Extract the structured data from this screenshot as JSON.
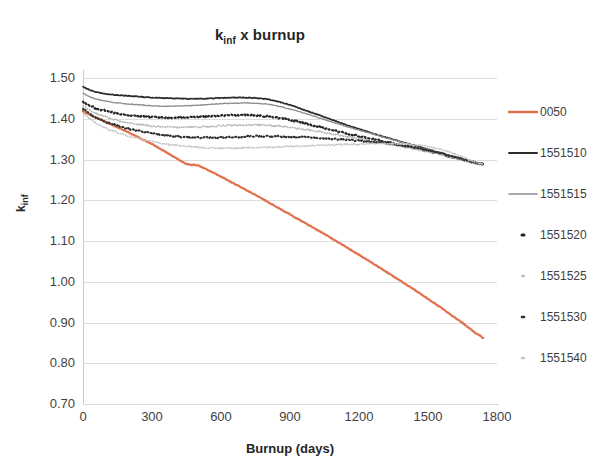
{
  "chart_data": {
    "type": "line",
    "title_main": "k",
    "title_sub": "inf",
    "title_rest": " x burnup",
    "xlabel": "Burnup (days)",
    "ylabel": "k_inf",
    "ylabel_main": "k",
    "ylabel_sub": "inf",
    "xlim": [
      0,
      1800
    ],
    "ylim": [
      0.7,
      1.5
    ],
    "grid": true,
    "legend_position": "right",
    "xticks": [
      0,
      300,
      600,
      900,
      1200,
      1500,
      1800
    ],
    "xtick_labels": [
      "0",
      "300",
      "600",
      "900",
      "1200",
      "1500",
      "1800"
    ],
    "yticks": [
      0.7,
      0.8,
      0.9,
      1.0,
      1.1,
      1.2,
      1.3,
      1.4,
      1.5
    ],
    "ytick_labels": [
      "0.70",
      "0.80",
      "0.90",
      "1.00",
      "1.10",
      "1.20",
      "1.30",
      "1.40",
      "1.50"
    ],
    "x": [
      0,
      50,
      100,
      150,
      200,
      250,
      300,
      350,
      400,
      450,
      500,
      550,
      600,
      650,
      700,
      750,
      800,
      850,
      900,
      950,
      1000,
      1050,
      1100,
      1150,
      1200,
      1250,
      1300,
      1350,
      1400,
      1450,
      1500,
      1550,
      1600,
      1650,
      1700,
      1740
    ],
    "series": [
      {
        "name": "0050",
        "color": "#E1704C",
        "style": "solid",
        "width": 2.2,
        "values": [
          1.418,
          1.405,
          1.392,
          1.379,
          1.366,
          1.352,
          1.338,
          1.322,
          1.305,
          1.288,
          1.286,
          1.272,
          1.258,
          1.243,
          1.228,
          1.213,
          1.197,
          1.181,
          1.165,
          1.149,
          1.133,
          1.117,
          1.1,
          1.083,
          1.066,
          1.049,
          1.031,
          1.013,
          0.995,
          0.977,
          0.958,
          0.939,
          0.919,
          0.899,
          0.877,
          0.862
        ]
      },
      {
        "name": "1551510",
        "color": "#2b2b2b",
        "style": "solid",
        "width": 1.7,
        "values": [
          1.478,
          1.466,
          1.461,
          1.458,
          1.456,
          1.454,
          1.452,
          1.451,
          1.45,
          1.449,
          1.449,
          1.45,
          1.451,
          1.452,
          1.452,
          1.451,
          1.448,
          1.442,
          1.434,
          1.424,
          1.414,
          1.404,
          1.394,
          1.384,
          1.375,
          1.366,
          1.357,
          1.349,
          1.341,
          1.333,
          1.325,
          1.317,
          1.309,
          1.301,
          1.293,
          1.288
        ]
      },
      {
        "name": "1551515",
        "color": "#8c8c8c",
        "style": "solid",
        "width": 1.3,
        "values": [
          1.462,
          1.449,
          1.443,
          1.439,
          1.436,
          1.434,
          1.432,
          1.431,
          1.431,
          1.432,
          1.433,
          1.435,
          1.437,
          1.438,
          1.439,
          1.438,
          1.436,
          1.431,
          1.424,
          1.416,
          1.407,
          1.398,
          1.389,
          1.38,
          1.372,
          1.364,
          1.356,
          1.348,
          1.34,
          1.332,
          1.324,
          1.316,
          1.308,
          1.3,
          1.292,
          1.288
        ]
      },
      {
        "name": "1551520",
        "color": "#262626",
        "style": "dotted",
        "width": 2.2,
        "values": [
          1.441,
          1.427,
          1.419,
          1.413,
          1.409,
          1.406,
          1.404,
          1.403,
          1.403,
          1.404,
          1.405,
          1.406,
          1.408,
          1.409,
          1.409,
          1.408,
          1.406,
          1.402,
          1.397,
          1.391,
          1.384,
          1.377,
          1.37,
          1.363,
          1.357,
          1.351,
          1.345,
          1.339,
          1.333,
          1.327,
          1.321,
          1.314,
          1.307,
          1.3,
          1.293,
          1.288
        ]
      },
      {
        "name": "1551525",
        "color": "#b5b5b5",
        "style": "dotted",
        "width": 1.5,
        "values": [
          1.431,
          1.414,
          1.404,
          1.396,
          1.39,
          1.386,
          1.382,
          1.38,
          1.379,
          1.379,
          1.38,
          1.381,
          1.383,
          1.384,
          1.385,
          1.385,
          1.384,
          1.382,
          1.379,
          1.375,
          1.371,
          1.366,
          1.361,
          1.356,
          1.351,
          1.346,
          1.341,
          1.336,
          1.33,
          1.325,
          1.319,
          1.313,
          1.306,
          1.299,
          1.292,
          1.288
        ]
      },
      {
        "name": "1551530",
        "color": "#303030",
        "style": "dotted",
        "width": 2.0,
        "values": [
          1.424,
          1.404,
          1.392,
          1.383,
          1.375,
          1.369,
          1.364,
          1.36,
          1.357,
          1.355,
          1.354,
          1.354,
          1.354,
          1.355,
          1.356,
          1.357,
          1.357,
          1.357,
          1.356,
          1.355,
          1.354,
          1.352,
          1.35,
          1.348,
          1.346,
          1.344,
          1.341,
          1.338,
          1.334,
          1.329,
          1.323,
          1.316,
          1.308,
          1.3,
          1.293,
          1.288
        ]
      },
      {
        "name": "1551540",
        "color": "#c5c5c5",
        "style": "dotted",
        "width": 1.5,
        "values": [
          1.414,
          1.391,
          1.377,
          1.366,
          1.357,
          1.35,
          1.344,
          1.339,
          1.335,
          1.332,
          1.33,
          1.329,
          1.328,
          1.328,
          1.328,
          1.329,
          1.33,
          1.331,
          1.332,
          1.333,
          1.334,
          1.335,
          1.336,
          1.337,
          1.338,
          1.339,
          1.339,
          1.339,
          1.338,
          1.336,
          1.332,
          1.326,
          1.317,
          1.306,
          1.295,
          1.288
        ]
      }
    ]
  },
  "legend": {
    "items": [
      {
        "label": "0050",
        "color": "#E1704C",
        "style": "solid",
        "width": 2.6
      },
      {
        "label": "1551510",
        "color": "#2b2b2b",
        "style": "solid",
        "width": 2.0
      },
      {
        "label": "1551515",
        "color": "#8c8c8c",
        "style": "solid",
        "width": 1.4
      },
      {
        "label": "1551520",
        "color": "#262626",
        "style": "dot",
        "width": 3.0
      },
      {
        "label": "1551525",
        "color": "#c0c0c0",
        "style": "dot",
        "width": 2.4
      },
      {
        "label": "1551530",
        "color": "#303030",
        "style": "dot",
        "width": 2.6
      },
      {
        "label": "1551540",
        "color": "#c5c5c5",
        "style": "dot",
        "width": 2.4
      }
    ]
  }
}
